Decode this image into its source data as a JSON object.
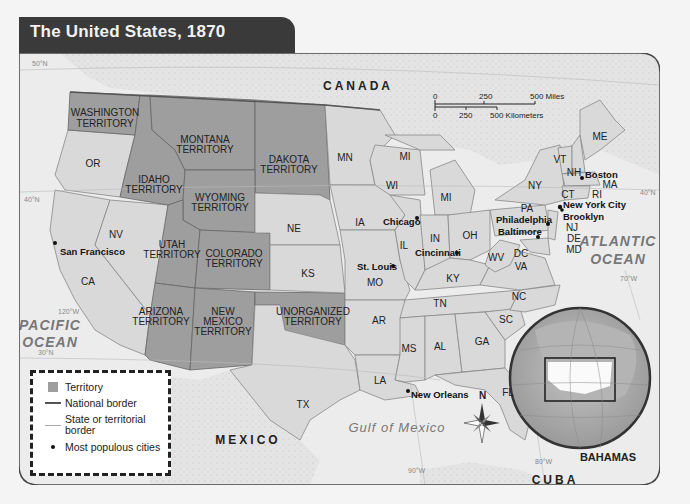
{
  "title": "The United States, 1870",
  "colors": {
    "territory": "#9e9e9e",
    "state": "#d9d9d9",
    "foreign_land": "#e6e6e6",
    "water": "#eeeeee",
    "title_bar": "#3a3a3a"
  },
  "countries": {
    "canada": "CANADA",
    "mexico": "MEXICO",
    "cuba": "CUBA",
    "bahamas": "BAHAMAS"
  },
  "water_bodies": {
    "pacific_1": "PACIFIC",
    "pacific_2": "OCEAN",
    "atlantic_1": "ATLANTIC",
    "atlantic_2": "OCEAN",
    "gulf": "Gulf of Mexico"
  },
  "territories": {
    "washington": [
      "WASHINGTON",
      "TERRITORY"
    ],
    "montana": [
      "MONTANA",
      "TERRITORY"
    ],
    "dakota": [
      "DAKOTA",
      "TERRITORY"
    ],
    "idaho": [
      "IDAHO",
      "TERRITORY"
    ],
    "wyoming": [
      "WYOMING",
      "TERRITORY"
    ],
    "utah": [
      "UTAH",
      "TERRITORY"
    ],
    "colorado": [
      "COLORADO",
      "TERRITORY"
    ],
    "arizona": [
      "ARIZONA",
      "TERRITORY"
    ],
    "new_mexico": [
      "NEW",
      "MEXICO",
      "TERRITORY"
    ],
    "unorganized": [
      "UNORGANIZED",
      "TERRITORY"
    ]
  },
  "states": {
    "or": "OR",
    "ca": "CA",
    "nv": "NV",
    "ne": "NE",
    "ks": "KS",
    "tx": "TX",
    "mn": "MN",
    "ia": "IA",
    "mo": "MO",
    "ar": "AR",
    "la": "LA",
    "wi": "WI",
    "mi_upper": "MI",
    "mi_lower": "MI",
    "il": "IL",
    "in": "IN",
    "oh": "OH",
    "ky": "KY",
    "tn": "TN",
    "ms": "MS",
    "al": "AL",
    "ga": "GA",
    "fl": "FL",
    "sc": "SC",
    "nc": "NC",
    "va": "VA",
    "wv": "WV",
    "dc": "DC",
    "md": "MD",
    "de": "DE",
    "nj": "NJ",
    "pa": "PA",
    "ny": "NY",
    "ct": "CT",
    "ri": "RI",
    "ma": "MA",
    "vt": "VT",
    "nh": "NH",
    "me": "ME"
  },
  "cities": {
    "san_francisco": "San Francisco",
    "chicago": "Chicago",
    "st_louis": "St. Louis",
    "cincinnati": "Cincinnati",
    "new_orleans": "New Orleans",
    "philadelphia": "Philadelphia",
    "baltimore": "Baltimore",
    "new_york": "New York City",
    "brooklyn": "Brooklyn",
    "boston": "Boston"
  },
  "graticule": {
    "lat_50": "50°N",
    "lat_40_west": "40°N",
    "lat_40_east": "40°N",
    "lat_30": "30°N",
    "lon_120": "120°W",
    "lon_90": "90°W",
    "lon_80": "80°W",
    "lon_70": "70°W"
  },
  "scale_bar": {
    "miles_0": "0",
    "miles_250": "250",
    "miles_500": "500 Miles",
    "km_0": "0",
    "km_250": "250",
    "km_500": "500 Kilometers"
  },
  "compass": {
    "north": "N"
  },
  "legend": {
    "territory": "Territory",
    "national_border": "National border",
    "state_border_1": "State or territorial",
    "state_border_2": "border",
    "cities": "Most populous cities"
  }
}
